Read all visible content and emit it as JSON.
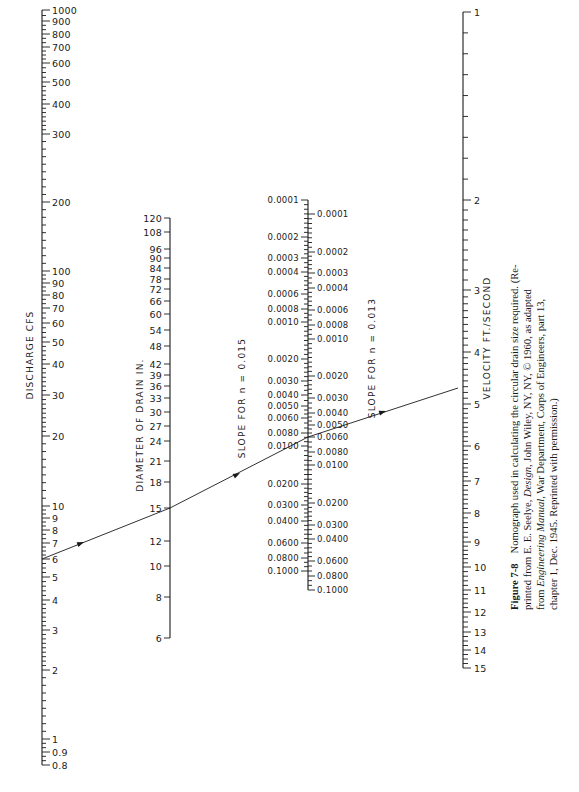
{
  "axes": {
    "discharge": {
      "title": "DISCHARGE CFS",
      "x": 42,
      "y_top": 10,
      "y_bottom": 712,
      "ticks": [
        {
          "label": "1000",
          "y": 10
        },
        {
          "label": "900",
          "y": 21
        },
        {
          "label": "800",
          "y": 34
        },
        {
          "label": "700",
          "y": 47
        },
        {
          "label": "600",
          "y": 63
        },
        {
          "label": "500",
          "y": 82
        },
        {
          "label": "400",
          "y": 104
        },
        {
          "label": "300",
          "y": 134
        },
        {
          "label": "200",
          "y": 202
        },
        {
          "label": "100",
          "y": 271
        },
        {
          "label": "90",
          "y": 283
        },
        {
          "label": "80",
          "y": 295
        },
        {
          "label": "70",
          "y": 308
        },
        {
          "label": "60",
          "y": 323
        },
        {
          "label": "50",
          "y": 342
        },
        {
          "label": "40",
          "y": 364
        },
        {
          "label": "30",
          "y": 395
        },
        {
          "label": "20",
          "y": 436
        },
        {
          "label": "10",
          "y": 506
        },
        {
          "label": "9",
          "y": 518
        },
        {
          "label": "8",
          "y": 530
        },
        {
          "label": "7",
          "y": 543
        },
        {
          "label": "6",
          "y": 559
        },
        {
          "label": "5",
          "y": 577
        },
        {
          "label": "4",
          "y": 600
        },
        {
          "label": "3",
          "y": 630
        },
        {
          "label": "2",
          "y": 670
        },
        {
          "label": "1",
          "y": 739
        },
        {
          "label": "0.9",
          "y": 752
        },
        {
          "label": "0.8",
          "y": 765
        }
      ]
    },
    "diameter": {
      "title": "DIAMETER OF DRAIN IN.",
      "x": 170,
      "y_top": 218,
      "y_bottom": 638,
      "ticks": [
        {
          "label": "120",
          "y": 218
        },
        {
          "label": "108",
          "y": 232
        },
        {
          "label": "96",
          "y": 249
        },
        {
          "label": "90",
          "y": 258
        },
        {
          "label": "84",
          "y": 268
        },
        {
          "label": "78",
          "y": 279
        },
        {
          "label": "72",
          "y": 289
        },
        {
          "label": "66",
          "y": 301
        },
        {
          "label": "60",
          "y": 314
        },
        {
          "label": "54",
          "y": 330
        },
        {
          "label": "48",
          "y": 346
        },
        {
          "label": "42",
          "y": 364
        },
        {
          "label": "39",
          "y": 375
        },
        {
          "label": "36",
          "y": 386
        },
        {
          "label": "33",
          "y": 398
        },
        {
          "label": "30",
          "y": 412
        },
        {
          "label": "27",
          "y": 426
        },
        {
          "label": "24",
          "y": 441
        },
        {
          "label": "21",
          "y": 461
        },
        {
          "label": "18",
          "y": 482
        },
        {
          "label": "15",
          "y": 508
        },
        {
          "label": "12",
          "y": 541
        },
        {
          "label": "10",
          "y": 566
        },
        {
          "label": "8",
          "y": 597
        },
        {
          "label": "6",
          "y": 638
        }
      ]
    },
    "slope_n015": {
      "title": "SLOPE FOR n = 0.015",
      "x": 308,
      "ticks": [
        {
          "label": "0.0001",
          "y": 200
        },
        {
          "label": "0.0002",
          "y": 237
        },
        {
          "label": "0.0003",
          "y": 258
        },
        {
          "label": "0.0004",
          "y": 272
        },
        {
          "label": "0.0006",
          "y": 294
        },
        {
          "label": "0.0008",
          "y": 309
        },
        {
          "label": "0.0010",
          "y": 322
        },
        {
          "label": "0.0020",
          "y": 359
        },
        {
          "label": "0.0030",
          "y": 381
        },
        {
          "label": "0.0040",
          "y": 395
        },
        {
          "label": "0.0050",
          "y": 406
        },
        {
          "label": "0.0060",
          "y": 418
        },
        {
          "label": "0.0080",
          "y": 433
        },
        {
          "label": "0.0100",
          "y": 446
        },
        {
          "label": "0.0200",
          "y": 484
        },
        {
          "label": "0.0300",
          "y": 505
        },
        {
          "label": "0.0400",
          "y": 521
        },
        {
          "label": "0.0600",
          "y": 543
        },
        {
          "label": "0.0800",
          "y": 558
        },
        {
          "label": "0.1000",
          "y": 571
        }
      ]
    },
    "slope_n013": {
      "title": "SLOPE FOR n = 0.013",
      "x": 308,
      "ticks": [
        {
          "label": "0.0001",
          "y": 214
        },
        {
          "label": "0.0002",
          "y": 252
        },
        {
          "label": "0.0003",
          "y": 273
        },
        {
          "label": "0.0004",
          "y": 288
        },
        {
          "label": "0.0006",
          "y": 310
        },
        {
          "label": "0.0008",
          "y": 325
        },
        {
          "label": "0.0010",
          "y": 339
        },
        {
          "label": "0.0020",
          "y": 376
        },
        {
          "label": "0.0030",
          "y": 398
        },
        {
          "label": "0.0040",
          "y": 413
        },
        {
          "label": "0.0050",
          "y": 425
        },
        {
          "label": "0.0060",
          "y": 437
        },
        {
          "label": "0.0080",
          "y": 452
        },
        {
          "label": "0.0100",
          "y": 465
        },
        {
          "label": "0.0200",
          "y": 503
        },
        {
          "label": "0.0300",
          "y": 525
        },
        {
          "label": "0.0400",
          "y": 539
        },
        {
          "label": "0.0600",
          "y": 561
        },
        {
          "label": "0.0800",
          "y": 576
        },
        {
          "label": "0.1000",
          "y": 590
        }
      ]
    },
    "velocity": {
      "title": "VELOCITY FT./SECOND",
      "x": 463,
      "y_top": 12,
      "y_bottom": 650,
      "ticks": [
        {
          "label": "1",
          "y": 12
        },
        {
          "label": "2",
          "y": 200
        },
        {
          "label": "3",
          "y": 290
        },
        {
          "label": "4",
          "y": 352
        },
        {
          "label": "5",
          "y": 404
        },
        {
          "label": "6",
          "y": 446
        },
        {
          "label": "7",
          "y": 481
        },
        {
          "label": "8",
          "y": 513
        },
        {
          "label": "9",
          "y": 542
        },
        {
          "label": "10",
          "y": 567
        },
        {
          "label": "11",
          "y": 590
        },
        {
          "label": "12",
          "y": 612
        },
        {
          "label": "13",
          "y": 632
        },
        {
          "label": "14",
          "y": 650
        },
        {
          "label": "15",
          "y": 668
        }
      ]
    }
  },
  "solution_line": {
    "points": [
      [
        42,
        559
      ],
      [
        170,
        508
      ],
      [
        308,
        437
      ],
      [
        458,
        388
      ]
    ],
    "arrow_positions": [
      [
        84,
        542
      ],
      [
        240,
        473
      ],
      [
        386,
        411
      ]
    ]
  },
  "caption": {
    "label": "Figure 7-8",
    "lines": [
      "Nomograph used in calculating the circular drain size required. (Re-",
      "printed from E. E. Seelye, Design, John Wiley, NY, NY, © 1960, as adapted",
      "from Engineering Manual, War Department, Corps of Engineers, part 13,",
      "chapter 1, Dec. 1945. Reprinted with permission.)"
    ],
    "line1": "Nomograph used in calculating the circular drain size required. (Re-",
    "line2a": "printed from E. E. Seelye, ",
    "line2b": "Design",
    "line2c": ", John Wiley, NY, NY, © 1960, as adapted",
    "line3a": "from ",
    "line3b": "Engineering Manual",
    "line3c": ", War Department, Corps of Engineers, part 13,",
    "line4": "chapter 1, Dec. 1945. Reprinted with permission.)"
  }
}
